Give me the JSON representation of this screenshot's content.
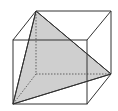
{
  "diagram": {
    "type": "cube-with-cross-section",
    "width": 118,
    "height": 111,
    "colors": {
      "background": "#ffffff",
      "edge": "#333333",
      "hidden_edge": "#555555",
      "shade": "#cfcfcf"
    },
    "front_face": {
      "x1": 13,
      "y1": 40,
      "x2": 87,
      "y2": 104
    },
    "back_face": {
      "x1": 36,
      "y1": 11,
      "x2": 111,
      "y2": 74
    },
    "triangle": {
      "points": "36,11 111,74 13,104"
    }
  }
}
